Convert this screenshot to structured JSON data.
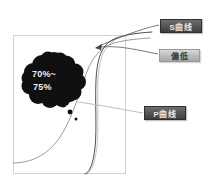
{
  "figure": {
    "title_region": "hand-drawn S-curve and P-curve diagram",
    "frame": {
      "left": 13,
      "top": 35,
      "right": 126,
      "bottom": 174,
      "color": "#d0d0d0"
    },
    "curves": [
      {
        "name": "s-curve",
        "label": "S曲线",
        "color": "#555555",
        "description": "steep sigmoid rising at right of plot"
      },
      {
        "name": "p-curve",
        "label": "P曲线",
        "color": "#8a8a8a",
        "description": "gentle rising curve from lower left"
      }
    ],
    "blob": {
      "line1": "70%~",
      "line2": "75%",
      "color": "#121212"
    },
    "dots": [
      {
        "cx": 63,
        "cy": 104,
        "r": 3.4
      },
      {
        "cx": 70,
        "cy": 112,
        "r": 2.4
      },
      {
        "cx": 76,
        "cy": 119,
        "r": 1.5
      }
    ]
  },
  "callouts": [
    {
      "id": "s-curve",
      "label": "S曲线",
      "style": "dark"
    },
    {
      "id": "low",
      "label": "偏低",
      "style": "light"
    },
    {
      "id": "p-curve",
      "label": "P曲线",
      "style": "dark"
    }
  ],
  "leaders": {
    "s_curve_target": {
      "x": 95,
      "y": 48
    },
    "low_target": {
      "x": 95,
      "y": 48
    },
    "p_curve_target": {
      "x": 78,
      "y": 102
    }
  }
}
